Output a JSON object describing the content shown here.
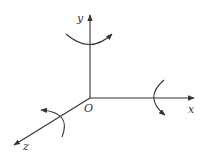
{
  "diagram": {
    "type": "3d-coordinate-axes-with-rotations",
    "origin": {
      "label": "O",
      "x": 90,
      "y": 98
    },
    "axes": [
      {
        "name": "x",
        "label": "x",
        "end": [
          194,
          98
        ]
      },
      {
        "name": "y",
        "label": "y",
        "end": [
          90,
          14
        ]
      },
      {
        "name": "z",
        "label": "z",
        "end": [
          14,
          145
        ]
      }
    ],
    "rotation_arrows": [
      {
        "about_axis": "y",
        "direction": "counterclockwise-viewed-from-top"
      },
      {
        "about_axis": "x",
        "direction": "rotation"
      },
      {
        "about_axis": "z",
        "direction": "rotation"
      }
    ],
    "colors": {
      "line": "#333333",
      "background": "#ffffff"
    }
  }
}
